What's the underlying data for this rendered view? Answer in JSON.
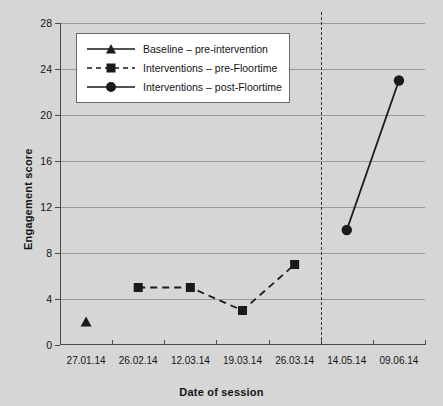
{
  "chart_data": {
    "type": "line",
    "title": "",
    "xlabel": "Date of session",
    "ylabel": "Engagement score",
    "categories": [
      "27.01.14",
      "26.02.14",
      "12.03.14",
      "19.03.14",
      "26.03.14",
      "14.05.14",
      "09.06.14"
    ],
    "ylim": [
      0,
      28
    ],
    "yticks": [
      0,
      4,
      8,
      12,
      16,
      20,
      24,
      28
    ],
    "grid": true,
    "legend_position": "upper left",
    "series": [
      {
        "name": "Baseline – pre-intervention",
        "marker": "triangle",
        "linestyle": "solid",
        "color": "#1a1a1a",
        "x": [
          "27.01.14"
        ],
        "values": [
          2
        ]
      },
      {
        "name": "Interventions – pre-Floortime",
        "marker": "square",
        "linestyle": "dashed",
        "color": "#1a1a1a",
        "x": [
          "26.02.14",
          "12.03.14",
          "19.03.14",
          "26.03.14"
        ],
        "values": [
          5,
          5,
          3,
          7
        ]
      },
      {
        "name": "Interventions – post-Floortime",
        "marker": "circle",
        "linestyle": "solid",
        "color": "#1a1a1a",
        "x": [
          "14.05.14",
          "09.06.14"
        ],
        "values": [
          10,
          23
        ]
      }
    ],
    "annotations": [
      {
        "type": "vertical-divider",
        "linestyle": "dashed",
        "between": [
          "26.03.14",
          "14.05.14"
        ]
      }
    ]
  },
  "colors": {
    "background": "#d6d6d6",
    "plot_background": "#d6d6d6",
    "gridline": "#9a9a9a",
    "axis": "#4a4a4a",
    "ink": "#1a1a1a",
    "legend_background": "#ffffff",
    "legend_border": "#6a6a6a"
  }
}
